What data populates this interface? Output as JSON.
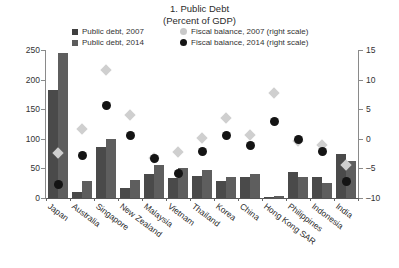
{
  "title": {
    "main": "1. Public Debt",
    "sub": "(Percent of GDP)"
  },
  "legend": {
    "items": [
      {
        "label": "Public debt, 2007",
        "marker": "square",
        "color": "#3f3f3f"
      },
      {
        "label": "Fiscal balance, 2007 (right scale)",
        "marker": "circle",
        "color": "#c9c9c9"
      },
      {
        "label": "Public debt, 2014",
        "marker": "square",
        "color": "#5c5c5c"
      },
      {
        "label": "Fiscal balance, 2014 (right scale)",
        "marker": "circle",
        "color": "#151515"
      }
    ]
  },
  "axes": {
    "left_ticks": [
      "250",
      "200",
      "150",
      "100",
      "50",
      "0"
    ],
    "right_ticks": [
      "15",
      "10",
      "5",
      "0",
      "-5",
      "-10"
    ]
  },
  "chart_data": {
    "type": "bar",
    "title": "1. Public Debt",
    "subtitle": "(Percent of GDP)",
    "xlabel": "",
    "ylabel": "Percent of GDP",
    "ylabel_right": "Percent of GDP",
    "ylim": [
      0,
      250
    ],
    "ylim_right": [
      -10,
      15
    ],
    "grid": false,
    "legend_position": "top",
    "categories": [
      "Japan",
      "Australia",
      "Singapore",
      "New Zealand",
      "Malaysia",
      "Vietnam",
      "Thailand",
      "Korea",
      "China",
      "Hong Kong SAR",
      "Philippines",
      "Indonesia",
      "India"
    ],
    "series": [
      {
        "name": "Public debt, 2007",
        "type": "bar",
        "axis": "left",
        "color": "#4a4a4a",
        "values": [
          183,
          10,
          86,
          17,
          41,
          34,
          38,
          29,
          35,
          2,
          44,
          35,
          74
        ]
      },
      {
        "name": "Public debt, 2014",
        "type": "bar",
        "axis": "left",
        "color": "#5e5e5e",
        "values": [
          245,
          29,
          99,
          30,
          56,
          51,
          47,
          36,
          41,
          3,
          36,
          26,
          62
        ]
      },
      {
        "name": "Fiscal balance, 2007 (right scale)",
        "type": "scatter",
        "axis": "right",
        "marker": "diamond",
        "color": "#cfcfcf",
        "values": [
          -2.4,
          1.6,
          11.6,
          4.0,
          -3.2,
          -2.2,
          0.2,
          3.5,
          0.6,
          7.7,
          -0.4,
          -1.0,
          -4.4
        ]
      },
      {
        "name": "Fiscal balance, 2014 (right scale)",
        "type": "scatter",
        "axis": "right",
        "marker": "circle",
        "color": "#141414",
        "values": [
          -7.7,
          -2.9,
          5.6,
          0.5,
          -3.4,
          -5.8,
          -2.2,
          0.5,
          -1.1,
          2.9,
          -0.1,
          -2.2,
          -7.2
        ]
      }
    ]
  }
}
